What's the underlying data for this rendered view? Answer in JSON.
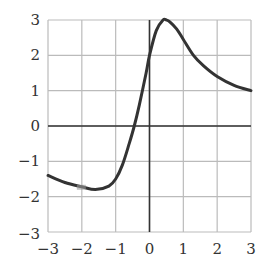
{
  "chart_data": {
    "type": "line",
    "title": "",
    "xlabel": "",
    "ylabel": "",
    "xlim": [
      -3,
      3
    ],
    "ylim": [
      -3,
      3
    ],
    "grid": true,
    "legend": null,
    "x_ticks": [
      "−3",
      "−2",
      "−1",
      "0",
      "1",
      "2",
      "3"
    ],
    "y_ticks": [
      "3",
      "2",
      "1",
      "0",
      "−1",
      "−2",
      "−3"
    ],
    "series": [
      {
        "name": "f(x)",
        "color": "#333333",
        "x": [
          -3.0,
          -2.5,
          -2.0,
          -1.6,
          -1.2,
          -1.0,
          -0.8,
          -0.6,
          -0.45,
          -0.3,
          -0.1,
          0.0,
          0.2,
          0.4,
          0.5,
          0.6,
          0.8,
          1.0,
          1.3,
          1.6,
          2.0,
          2.5,
          3.0
        ],
        "y": [
          -1.4,
          -1.6,
          -1.72,
          -1.8,
          -1.7,
          -1.5,
          -1.1,
          -0.5,
          0.0,
          0.6,
          1.5,
          2.0,
          2.7,
          3.0,
          3.0,
          2.95,
          2.75,
          2.45,
          2.0,
          1.7,
          1.4,
          1.15,
          1.0
        ]
      }
    ],
    "annotations": [
      {
        "type": "marker",
        "x": -2.0,
        "y": -1.72,
        "description": "small gray rectangle on curve"
      }
    ]
  },
  "colors": {
    "grid": "#bbbbbb",
    "axis": "#333333",
    "curve": "#333333",
    "marker": "#999999"
  }
}
